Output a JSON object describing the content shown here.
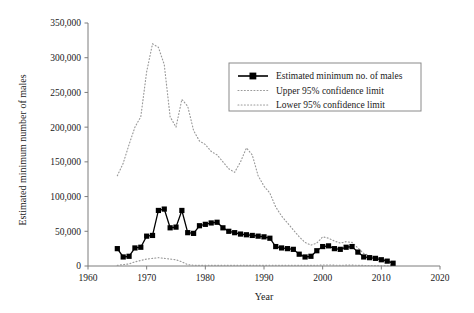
{
  "chart_data": {
    "type": "line",
    "title": "",
    "xlabel": "Year",
    "ylabel": "Estimated minimum number of males",
    "xlim": [
      1960,
      2020
    ],
    "ylim": [
      0,
      350000
    ],
    "xticks": [
      "1960",
      "1970",
      "1980",
      "1990",
      "2000",
      "2010",
      "2020"
    ],
    "xtick_values": [
      1960,
      1970,
      1980,
      1990,
      2000,
      2010,
      2020
    ],
    "yticks": [
      "0",
      "50,000",
      "100,000",
      "150,000",
      "200,000",
      "250,000",
      "300,000",
      "350,000"
    ],
    "ytick_values": [
      0,
      50000,
      100000,
      150000,
      200000,
      250000,
      300000,
      350000
    ],
    "grid": false,
    "legend_position": "upper-right",
    "x": [
      1965,
      1966,
      1967,
      1968,
      1969,
      1970,
      1971,
      1972,
      1973,
      1974,
      1975,
      1976,
      1977,
      1978,
      1979,
      1980,
      1981,
      1982,
      1983,
      1984,
      1985,
      1986,
      1987,
      1988,
      1989,
      1990,
      1991,
      1992,
      1993,
      1994,
      1995,
      1996,
      1997,
      1998,
      1999,
      2000,
      2001,
      2002,
      2003,
      2004,
      2005,
      2006,
      2007,
      2008,
      2009,
      2010,
      2011,
      2012
    ],
    "series": [
      {
        "name": "Estimated minimum no. of males",
        "style": "solid-square-markers",
        "color": "#000000",
        "values": [
          25000,
          13000,
          14000,
          26000,
          27000,
          43000,
          44000,
          80000,
          82000,
          55000,
          56000,
          80000,
          48000,
          47000,
          58000,
          60000,
          62000,
          63000,
          55000,
          50000,
          48000,
          46000,
          45000,
          44000,
          43000,
          42000,
          40000,
          28000,
          26000,
          25000,
          24000,
          17000,
          13000,
          14000,
          22000,
          28000,
          29000,
          25000,
          24000,
          27000,
          28000,
          20000,
          13000,
          12000,
          11000,
          9000,
          7000,
          4000
        ]
      },
      {
        "name": "Upper 95% confidence limit",
        "style": "dotted",
        "color": "#9a9a9a",
        "values": [
          130000,
          148000,
          175000,
          200000,
          215000,
          280000,
          320000,
          315000,
          290000,
          215000,
          200000,
          240000,
          230000,
          195000,
          180000,
          175000,
          165000,
          160000,
          150000,
          140000,
          135000,
          150000,
          170000,
          160000,
          130000,
          115000,
          105000,
          85000,
          72000,
          62000,
          52000,
          42000,
          34000,
          30000,
          33000,
          42000,
          40000,
          36000,
          33000,
          35000,
          34000,
          26000,
          18000,
          15000,
          13000,
          11000,
          8000,
          5000
        ]
      },
      {
        "name": "Lower 95% confidence limit",
        "style": "dotted",
        "color": "#9a9a9a",
        "values": [
          1000,
          2000,
          3000,
          6000,
          8000,
          10000,
          11000,
          12000,
          11000,
          10000,
          9000,
          6000,
          2000,
          1000,
          1000,
          1000,
          1000,
          1000,
          1000,
          1000,
          1000,
          1000,
          1000,
          1000,
          1000,
          1000,
          1000,
          1000,
          1000,
          1000,
          1000,
          1000,
          1000,
          1000,
          1000,
          1500,
          1500,
          1200,
          1000,
          1200,
          1200,
          1000,
          800,
          700,
          600,
          500,
          400,
          300
        ]
      }
    ]
  },
  "legend": {
    "entries": [
      {
        "label": "Estimated minimum no. of males",
        "swatch": "line-square-marker"
      },
      {
        "label": "Upper 95% confidence limit",
        "swatch": "dotted-line"
      },
      {
        "label": "Lower 95% confidence limit",
        "swatch": "dotted-line"
      }
    ]
  }
}
